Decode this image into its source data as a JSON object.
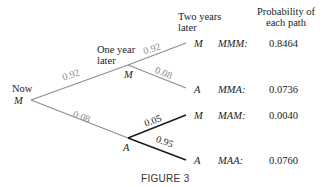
{
  "diagram": {
    "type": "probability-tree",
    "headers": {
      "now": "Now",
      "one_year": [
        "One year",
        "later"
      ],
      "two_years": [
        "Two years",
        "later"
      ],
      "probability": [
        "Probability of",
        "each path"
      ]
    },
    "root": {
      "label": "M"
    },
    "level1": [
      {
        "label": "M",
        "edge_prob": "0.92"
      },
      {
        "label": "A",
        "edge_prob": "0.08"
      }
    ],
    "level2": [
      {
        "label": "M",
        "edge_prob": "0.92",
        "path": "MMM:",
        "path_prob": "0.8464"
      },
      {
        "label": "A",
        "edge_prob": "0.08",
        "path": "MMA:",
        "path_prob": "0.0736"
      },
      {
        "label": "M",
        "edge_prob": "0.05",
        "path": "MAM:",
        "path_prob": "0.0040"
      },
      {
        "label": "A",
        "edge_prob": "0.95",
        "path": "MAA:",
        "path_prob": "0.0760"
      }
    ],
    "caption": "FIGURE 3",
    "colors": {
      "gray_edge": "#9a9a9a",
      "dark_edge": "#1a1a1a",
      "text": "#222222"
    }
  }
}
